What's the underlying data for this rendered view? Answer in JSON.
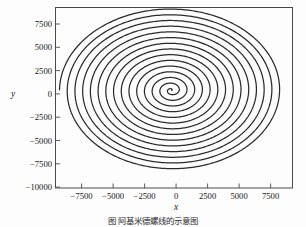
{
  "figure": {
    "caption": "图  阿基米德螺线的示意图",
    "background_color": "#fdfdfd",
    "frame_color": "#4a4a4a",
    "curve_color": "#2b2b2b"
  },
  "chart_data": {
    "type": "line",
    "title": "",
    "subtitle": "",
    "xlabel": "x",
    "ylabel": "y",
    "xlim": [
      -9200,
      9600
    ],
    "ylim": [
      -10500,
      8900
    ],
    "xticks": [
      -7500,
      -5000,
      -2500,
      0,
      2500,
      5000,
      7500
    ],
    "xtick_labels": [
      "−7500",
      "−5000",
      "−2500",
      "0",
      "2500",
      "5000",
      "7500"
    ],
    "yticks": [
      7500,
      5000,
      2500,
      0,
      -2500,
      -5000,
      -7500,
      -10000
    ],
    "ytick_labels": [
      "7500",
      "5000",
      "2500",
      "0",
      "−2500",
      "−5000",
      "−7500",
      "−10000"
    ],
    "grid": false,
    "legend": false,
    "legend_position": "none",
    "series": [
      {
        "name": "Archimedean spiral",
        "description": "r = a*theta, plotted parametrically as x = r*cos(theta), y = r*sin(theta)",
        "parametric": {
          "r_coefficient": 97.5,
          "theta_start": 0.0,
          "theta_end": 91.1,
          "turns": 14.5,
          "r_max": 8880
        },
        "center": [
          0,
          0
        ],
        "endpoint": [
          -7550,
          -5650
        ],
        "x_extent": [
          -8850,
          8900
        ],
        "y_extent": [
          -9450,
          8650
        ]
      }
    ]
  },
  "axes": {
    "x_axis_label": "x",
    "y_axis_label": "y"
  }
}
